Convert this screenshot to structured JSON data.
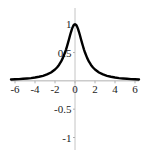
{
  "figure": {
    "name": "function-plot",
    "background": "#ffffff",
    "width": 146,
    "height": 154
  },
  "chart_data": {
    "type": "line",
    "title": "",
    "subtitle": "",
    "xlabel": "",
    "ylabel": "",
    "xlim": [
      -6.4,
      6.4
    ],
    "ylim": [
      -1.15,
      1.18
    ],
    "grid": false,
    "legend": null,
    "axis_color": "#b0b0b0",
    "curve_color": "#000000",
    "curve_width": 2.4,
    "x_ticks": [
      -6,
      -4,
      -2,
      0,
      2,
      4,
      6
    ],
    "x_tick_labels": [
      "-6",
      "-4",
      "-2",
      "0",
      "2",
      "4",
      "6"
    ],
    "y_ticks": [
      -1,
      -0.5,
      0.5,
      1
    ],
    "y_tick_labels": [
      "-1",
      "-0.5",
      "0.5",
      "1"
    ],
    "series": [
      {
        "name": "peaked-curve",
        "color": "#000000",
        "x": [
          -6.4,
          -6.0,
          -5.6,
          -5.2,
          -4.8,
          -4.4,
          -4.0,
          -3.6,
          -3.2,
          -2.8,
          -2.4,
          -2.0,
          -1.8,
          -1.6,
          -1.4,
          -1.2,
          -1.0,
          -0.9,
          -0.8,
          -0.7,
          -0.6,
          -0.5,
          -0.4,
          -0.3,
          -0.2,
          -0.1,
          0.0,
          0.1,
          0.2,
          0.3,
          0.4,
          0.5,
          0.6,
          0.7,
          0.8,
          0.9,
          1.0,
          1.2,
          1.4,
          1.6,
          1.8,
          2.0,
          2.4,
          2.8,
          3.2,
          3.6,
          4.0,
          4.4,
          4.8,
          5.2,
          5.6,
          6.0,
          6.4
        ],
        "y": [
          0.024,
          0.027,
          0.031,
          0.036,
          0.042,
          0.049,
          0.059,
          0.072,
          0.089,
          0.113,
          0.148,
          0.2,
          0.236,
          0.281,
          0.338,
          0.41,
          0.5,
          0.552,
          0.61,
          0.671,
          0.735,
          0.8,
          0.862,
          0.917,
          0.962,
          0.99,
          1.0,
          0.99,
          0.962,
          0.917,
          0.862,
          0.8,
          0.735,
          0.671,
          0.61,
          0.552,
          0.5,
          0.41,
          0.338,
          0.281,
          0.236,
          0.2,
          0.148,
          0.113,
          0.089,
          0.072,
          0.059,
          0.049,
          0.042,
          0.036,
          0.031,
          0.027,
          0.024
        ]
      }
    ]
  }
}
